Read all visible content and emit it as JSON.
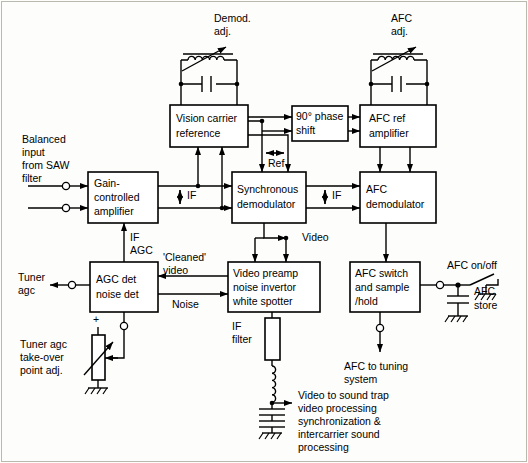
{
  "diagram": {
    "blocks": [
      {
        "id": "gain_amp",
        "lines": [
          "Gain-",
          "controlled",
          "amplifier"
        ]
      },
      {
        "id": "vision_ref",
        "lines": [
          "Vision carrier",
          "reference"
        ]
      },
      {
        "id": "phase_shift",
        "lines": [
          "90° phase",
          "shift"
        ]
      },
      {
        "id": "afc_ref",
        "lines": [
          "AFC ref",
          "amplifier"
        ]
      },
      {
        "id": "sync_demod",
        "lines": [
          "Synchronous",
          "demodulator"
        ]
      },
      {
        "id": "afc_demod",
        "lines": [
          "AFC",
          "demodulator"
        ]
      },
      {
        "id": "agc_det",
        "lines": [
          "AGC det",
          "noise det"
        ]
      },
      {
        "id": "video_pre",
        "lines": [
          "Video preamp",
          "noise invertor",
          "white spotter"
        ]
      },
      {
        "id": "afc_switch",
        "lines": [
          "AFC switch",
          "and sample",
          "/hold"
        ]
      }
    ],
    "labels": {
      "demod_adj": [
        "Demod.",
        "adj."
      ],
      "afc_adj": [
        "AFC",
        "adj."
      ],
      "balanced_input": [
        "Balanced",
        "input",
        "from SAW",
        "filter"
      ],
      "if_1": "IF",
      "if_2": "IF",
      "ref": "Ref",
      "video": "Video",
      "if_agc": [
        "IF",
        "AGC"
      ],
      "tuner_agc": [
        "Tuner",
        "agc"
      ],
      "cleaned_video": [
        "'Cleaned'",
        "video"
      ],
      "noise": "Noise",
      "if_filter": [
        "IF",
        "filter"
      ],
      "tuner_takeover": [
        "Tuner agc",
        "take-over",
        "point adj."
      ],
      "plus": "+",
      "afc_onoff": "AFC on/off",
      "afc_store": [
        "AFC",
        "store"
      ],
      "afc_to_tuning": [
        "AFC to tuning",
        "system"
      ],
      "video_out": [
        "Video to sound trap",
        "video processing",
        "synchronization &",
        "intercarrier sound",
        "processing"
      ]
    },
    "colors": {
      "line": "#000000",
      "block_fill": "#ffffff",
      "page_bg": "#fdfdfb",
      "frame": "#b9b9b0"
    }
  }
}
